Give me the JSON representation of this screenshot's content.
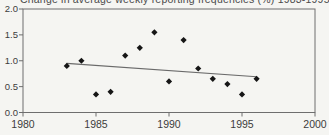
{
  "title": "Change in average weekly reporting frequencies (%) 1983-1995",
  "chart_data": {
    "type": "scatter",
    "title": "Change in average weekly reporting frequencies (%) 1983-1995",
    "xlabel": "",
    "ylabel": "",
    "x": [
      1983,
      1984,
      1985,
      1986,
      1987,
      1988,
      1989,
      1990,
      1991,
      1992,
      1993,
      1994,
      1995,
      1996
    ],
    "values": [
      0.9,
      1.0,
      0.35,
      0.4,
      1.1,
      1.25,
      1.55,
      0.6,
      1.4,
      0.85,
      0.65,
      0.55,
      0.35,
      0.65
    ],
    "trendline": {
      "x1": 1983,
      "y1": 0.95,
      "x2": 1996,
      "y2": 0.69
    },
    "xlim": [
      1980,
      2000
    ],
    "ylim": [
      0.0,
      2.0
    ],
    "xtick_labels": [
      "1980",
      "1985",
      "1990",
      "1995",
      "2000"
    ],
    "xtick_values": [
      1980,
      1985,
      1990,
      1995,
      2000
    ],
    "ytick_labels": [
      "0.0",
      "0.5",
      "1.0",
      "1.5",
      "2.0"
    ],
    "ytick_values": [
      0.0,
      0.5,
      1.0,
      1.5,
      2.0
    ],
    "grid": false,
    "legend": "none",
    "marker": "diamond",
    "colors": {
      "marker": "#161616",
      "trend_line": "#6a6a6a",
      "axis_line": "#6e6e6e",
      "tick_text": "#3c3c3c",
      "title_text": "#4a4a4a",
      "background": "#f5f5f2"
    }
  }
}
